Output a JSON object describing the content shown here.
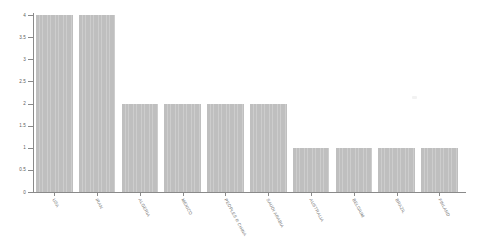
{
  "chart_data": {
    "type": "bar",
    "title": "",
    "subtitle": "",
    "xlabel": "",
    "ylabel": "",
    "categories": [
      "USA",
      "IRAN",
      "ALGERIA",
      "MEXICO",
      "PEOPLES R CHINA",
      "SAUDI ARABIA",
      "AUSTRALIA",
      "BELGIUM",
      "BRAZIL",
      "FINLAND"
    ],
    "values": [
      4,
      4,
      2,
      2,
      2,
      2,
      1,
      1,
      1,
      1
    ],
    "ylim": [
      0,
      4
    ],
    "ytick_labels": [
      "0",
      "0.5",
      "1",
      "1.5",
      "2",
      "2.5",
      "3",
      "3.5",
      "4"
    ],
    "ytick_values": [
      0,
      0.5,
      1,
      1.5,
      2,
      2.5,
      3,
      3.5,
      4
    ],
    "grid": false,
    "legend": false,
    "legend_position": "none",
    "bar_color": "#bfbfbf",
    "axis_color": "#8a8a8a",
    "background_color": "#ffffff",
    "xtick_label_rotation": 62,
    "annotations": []
  }
}
